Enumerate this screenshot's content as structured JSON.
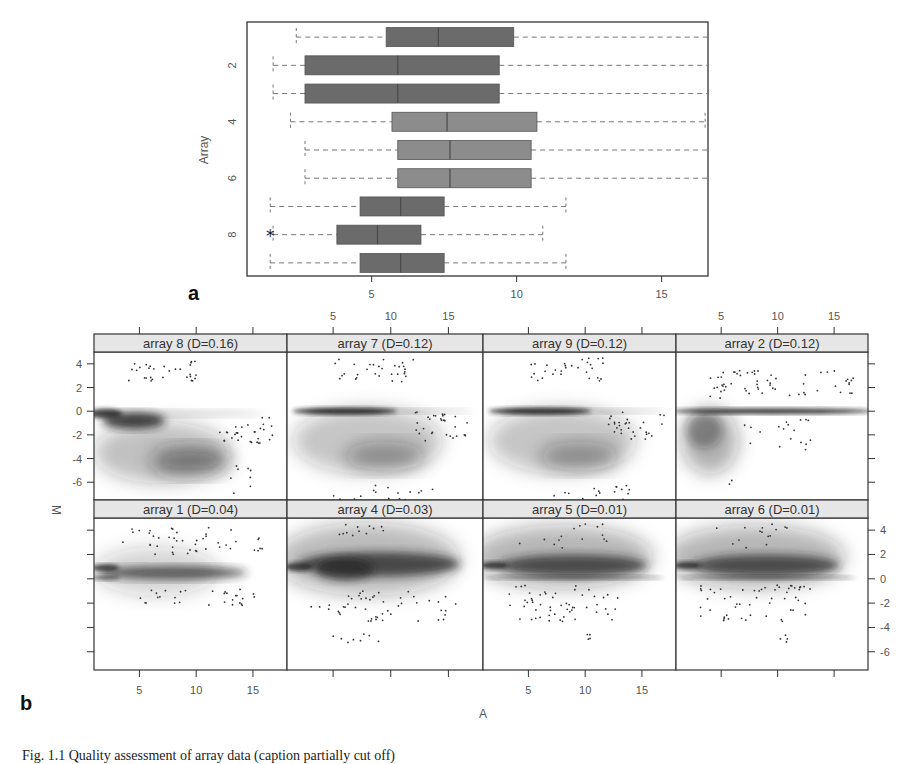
{
  "figure": {
    "panel_a_label": "a",
    "panel_b_label": "b",
    "caption_partial": "Fig. 1.1 Quality assessment of array data (caption partially cut off)"
  },
  "chart_data": [
    {
      "type": "boxplot",
      "panel": "a",
      "orientation": "horizontal",
      "title": "",
      "xlabel": "",
      "ylabel": "Array",
      "xlim": [
        0.7,
        16.6
      ],
      "x_ticks": [
        5,
        10,
        15
      ],
      "y_ticks": [
        2,
        4,
        6,
        8
      ],
      "categories": [
        "1",
        "2",
        "3",
        "4",
        "5",
        "6",
        "7",
        "8",
        "9"
      ],
      "colors": {
        "dark": "#6b6b6b",
        "light": "#8c8c8c",
        "whisker": "#777777",
        "frame": "#333333"
      },
      "boxes": [
        {
          "array": 1,
          "whisker_low": 2.4,
          "q1": 5.5,
          "median": 7.3,
          "q3": 9.9,
          "whisker_high": 16.6,
          "shade": "dark"
        },
        {
          "array": 2,
          "whisker_low": 1.6,
          "q1": 2.7,
          "median": 5.9,
          "q3": 9.4,
          "whisker_high": 16.6,
          "shade": "dark"
        },
        {
          "array": 3,
          "whisker_low": 1.6,
          "q1": 2.7,
          "median": 5.9,
          "q3": 9.4,
          "whisker_high": 16.6,
          "shade": "dark"
        },
        {
          "array": 4,
          "whisker_low": 2.2,
          "q1": 5.7,
          "median": 7.6,
          "q3": 10.7,
          "whisker_high": 16.5,
          "shade": "light"
        },
        {
          "array": 5,
          "whisker_low": 2.7,
          "q1": 5.9,
          "median": 7.7,
          "q3": 10.5,
          "whisker_high": 16.6,
          "shade": "light"
        },
        {
          "array": 6,
          "whisker_low": 2.7,
          "q1": 5.9,
          "median": 7.7,
          "q3": 10.5,
          "whisker_high": 16.6,
          "shade": "light"
        },
        {
          "array": 7,
          "whisker_low": 1.5,
          "q1": 4.6,
          "median": 6.0,
          "q3": 7.5,
          "whisker_high": 11.7,
          "shade": "dark"
        },
        {
          "array": 8,
          "whisker_low": 1.6,
          "q1": 3.8,
          "median": 5.2,
          "q3": 6.7,
          "whisker_high": 10.9,
          "shade": "dark",
          "outliers": [
            1.5
          ]
        },
        {
          "array": 9,
          "whisker_low": 1.5,
          "q1": 4.6,
          "median": 6.0,
          "q3": 7.5,
          "whisker_high": 11.7,
          "shade": "dark"
        }
      ]
    },
    {
      "type": "scatter",
      "subtype": "MA-plot density (smoothScatter) trellis",
      "panel": "b",
      "xlabel": "A",
      "ylabel": "M",
      "xlim": [
        1,
        18
      ],
      "ylim": [
        -7.5,
        5
      ],
      "x_ticks": [
        5,
        10,
        15
      ],
      "y_ticks": [
        4,
        2,
        0,
        -2,
        -4,
        -6
      ],
      "layout": {
        "rows": 2,
        "cols": 4,
        "grid": false,
        "strip_color": "#e6e6e6"
      },
      "panels": [
        {
          "row": 1,
          "col": 1,
          "label": "array 8 (D=0.16)",
          "array": 8,
          "D": 0.16,
          "trend": "strong downward bias, mass near M=-4 at A=8-10"
        },
        {
          "row": 1,
          "col": 2,
          "label": "array 7 (D=0.12)",
          "array": 7,
          "D": 0.12,
          "trend": "dense band at M=0, diffuse cloud down to M=-4"
        },
        {
          "row": 1,
          "col": 3,
          "label": "array 9 (D=0.12)",
          "array": 9,
          "D": 0.12,
          "trend": "dense band at M=0, diffuse cloud down to M=-4"
        },
        {
          "row": 1,
          "col": 4,
          "label": "array 2 (D=0.12)",
          "array": 2,
          "D": 0.12,
          "trend": "tight band at M=0, wedge down to M=-6 at low A"
        },
        {
          "row": 2,
          "col": 1,
          "label": "array 1 (D=0.04)",
          "array": 1,
          "D": 0.04,
          "trend": "band around M=0.5, narrowing with A"
        },
        {
          "row": 2,
          "col": 2,
          "label": "array 4 (D=0.03)",
          "array": 4,
          "D": 0.03,
          "trend": "wide dense band M=0-2 across A"
        },
        {
          "row": 2,
          "col": 3,
          "label": "array 5 (D=0.01)",
          "array": 5,
          "D": 0.01,
          "trend": "dense band M=0-2 tapering to M=0 at high A"
        },
        {
          "row": 2,
          "col": 4,
          "label": "array 6 (D=0.01)",
          "array": 6,
          "D": 0.01,
          "trend": "dense band M=0-2 tapering to M=0 at high A"
        }
      ]
    }
  ],
  "axis_text": {
    "a": {
      "ylabel": "Array",
      "x_ticks": [
        "5",
        "10",
        "15"
      ],
      "y_ticks": [
        "2",
        "4",
        "6",
        "8"
      ]
    },
    "b": {
      "xlabel": "A",
      "ylabel": "M",
      "x_ticks": [
        "5",
        "10",
        "15"
      ],
      "y_ticks": [
        "4",
        "2",
        "0",
        "-2",
        "-4",
        "-6"
      ]
    }
  },
  "strips": [
    "array 8 (D=0.16)",
    "array 7 (D=0.12)",
    "array 9 (D=0.12)",
    "array 2 (D=0.12)",
    "array 1 (D=0.04)",
    "array 4 (D=0.03)",
    "array 5 (D=0.01)",
    "array 6 (D=0.01)"
  ]
}
